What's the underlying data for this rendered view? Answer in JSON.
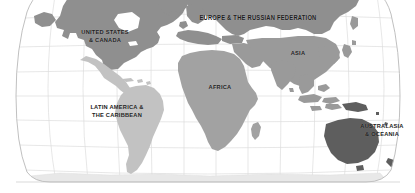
{
  "figure": {
    "type": "world-map",
    "projection": "robinson",
    "background_color": "#ffffff",
    "graticule_color": "#d8d8d8",
    "outline_color": "#b5b5b5",
    "label_color": "#1d1d1d"
  },
  "regions": [
    {
      "id": "north-america",
      "label": "UNITED STATES\n& CANADA",
      "color": "#8f8f8f"
    },
    {
      "id": "europe-russia",
      "label": "EUROPE & THE RUSSIAN FEDERATION",
      "color": "#8f8f8f"
    },
    {
      "id": "asia",
      "label": "ASIA",
      "color": "#9a9a9a"
    },
    {
      "id": "africa",
      "label": "AFRICA",
      "color": "#a2a2a2"
    },
    {
      "id": "latin-america",
      "label": "LATIN AMERICA &\nTHE CARIBBEAN",
      "color": "#c2c2c2"
    },
    {
      "id": "oceania",
      "label": "AUSTRALASIA\n& OCEANIA",
      "color": "#5e5e5e"
    },
    {
      "id": "antarctica",
      "label": "",
      "color": "#e8e8e8"
    }
  ]
}
